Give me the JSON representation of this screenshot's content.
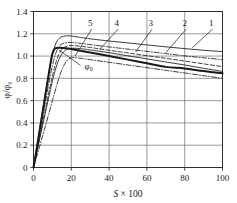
{
  "chart_data": {
    "type": "line",
    "title": "",
    "xlabel": "S × 100",
    "ylabel": "φ/φ₀",
    "xlim": [
      0,
      100
    ],
    "ylim": [
      0,
      1.4
    ],
    "grid": true,
    "legend_position": "inline-callouts",
    "xticks": [
      "0",
      "20",
      "40",
      "60",
      "80",
      "100"
    ],
    "xtick_values": [
      0,
      20,
      40,
      60,
      80,
      100
    ],
    "yticks": [
      "0",
      "0.2",
      "0.4",
      "0.6",
      "0.8",
      "1.0",
      "1.2",
      "1.4"
    ],
    "ytick_values": [
      0,
      0.2,
      0.4,
      0.6,
      0.8,
      1.0,
      1.2,
      1.4
    ],
    "annotations": [
      {
        "text": "φ₀",
        "x": 27,
        "y": 0.88,
        "points_to_x": 13.5,
        "points_to_y": 1.055
      }
    ],
    "series": [
      {
        "name": "1",
        "label": "1",
        "style": "solid-thin",
        "label_x": 94,
        "label_y": 1.27,
        "leader_to_x": 84,
        "leader_to_y": 1.075,
        "x": [
          0,
          2,
          4,
          6,
          8,
          10,
          12,
          14,
          16,
          18,
          20,
          22,
          24,
          26,
          30,
          40,
          50,
          60,
          70,
          80,
          90,
          100
        ],
        "y": [
          0,
          0.21,
          0.43,
          0.64,
          0.84,
          1.01,
          1.12,
          1.165,
          1.178,
          1.182,
          1.18,
          1.175,
          1.17,
          1.165,
          1.155,
          1.135,
          1.118,
          1.1,
          1.083,
          1.067,
          1.052,
          1.04
        ]
      },
      {
        "name": "2",
        "label": "2",
        "style": "dash-dot",
        "label_x": 80,
        "label_y": 1.27,
        "leader_to_x": 70,
        "leader_to_y": 1.03,
        "x": [
          0,
          2,
          4,
          6,
          8,
          10,
          12,
          14,
          16,
          18,
          20,
          22,
          24,
          26,
          30,
          40,
          50,
          60,
          70,
          80,
          90,
          100
        ],
        "y": [
          0,
          0.185,
          0.375,
          0.56,
          0.745,
          0.915,
          1.035,
          1.095,
          1.115,
          1.122,
          1.122,
          1.12,
          1.116,
          1.112,
          1.103,
          1.082,
          1.062,
          1.042,
          1.022,
          1.002,
          0.985,
          0.968
        ]
      },
      {
        "name": "3",
        "label": "3",
        "style": "dashed",
        "label_x": 62,
        "label_y": 1.27,
        "leader_to_x": 54,
        "leader_to_y": 1.035,
        "x": [
          0,
          2,
          4,
          6,
          8,
          10,
          12,
          14,
          16,
          18,
          20,
          22,
          24,
          26,
          30,
          40,
          50,
          60,
          70,
          80,
          90,
          100
        ],
        "y": [
          0,
          0.165,
          0.335,
          0.5,
          0.665,
          0.82,
          0.95,
          1.035,
          1.075,
          1.09,
          1.095,
          1.093,
          1.09,
          1.086,
          1.077,
          1.052,
          1.028,
          1.004,
          0.98,
          0.955,
          0.93,
          0.905
        ]
      },
      {
        "name": "4",
        "label": "4",
        "style": "solid-thin",
        "label_x": 44,
        "label_y": 1.27,
        "leader_to_x": 35,
        "leader_to_y": 1.06,
        "x": [
          0,
          2,
          4,
          6,
          8,
          10,
          12,
          14,
          16,
          18,
          20,
          22,
          24,
          26,
          30,
          40,
          50,
          60,
          70,
          80,
          90,
          100
        ],
        "y": [
          0,
          0.155,
          0.315,
          0.47,
          0.625,
          0.775,
          0.9,
          0.99,
          1.04,
          1.062,
          1.07,
          1.07,
          1.068,
          1.065,
          1.055,
          1.03,
          1.002,
          0.975,
          0.947,
          0.92,
          0.89,
          0.862
        ]
      },
      {
        "name": "5",
        "label": "5",
        "style": "dash-dot",
        "label_x": 30,
        "label_y": 1.27,
        "leader_to_x": 22,
        "leader_to_y": 1.0,
        "x": [
          0,
          2,
          4,
          6,
          8,
          10,
          12,
          14,
          16,
          18,
          20,
          22,
          24,
          26,
          30,
          40,
          50,
          60,
          70,
          80,
          90,
          100
        ],
        "y": [
          0,
          0.115,
          0.235,
          0.355,
          0.475,
          0.6,
          0.72,
          0.83,
          0.915,
          0.965,
          0.985,
          0.985,
          0.982,
          0.978,
          0.968,
          0.944,
          0.92,
          0.896,
          0.872,
          0.848,
          0.824,
          0.8
        ]
      },
      {
        "name": "phi0",
        "label": "φ₀",
        "style": "solid-thick",
        "label_x": 27,
        "label_y": 0.88,
        "leader_to_x": 13.5,
        "leader_to_y": 1.055,
        "x": [
          0,
          2,
          4,
          6,
          8,
          9,
          10,
          11,
          12,
          14,
          16,
          18,
          20,
          24,
          30,
          40,
          50,
          60,
          70,
          80,
          90,
          100
        ],
        "y": [
          0,
          0.2,
          0.41,
          0.62,
          0.83,
          0.935,
          1.02,
          1.06,
          1.072,
          1.075,
          1.072,
          1.068,
          1.063,
          1.05,
          1.032,
          1.0,
          0.968,
          0.935,
          0.903,
          0.888,
          0.865,
          0.845
        ]
      }
    ]
  },
  "axis": {
    "y_label": "φ/φ₀",
    "x_label_italic": "S",
    "x_label_rest": " × 100"
  }
}
